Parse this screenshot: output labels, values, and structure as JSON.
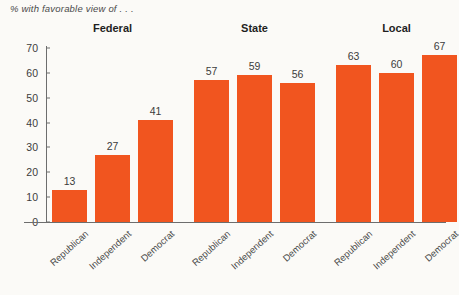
{
  "subtitle": "% with favorable view of . . .",
  "colors": {
    "bar": "#f1551f",
    "axis": "#6d6d6d",
    "text": "#3c3c3c",
    "background": "#fbfaf7"
  },
  "groups": [
    {
      "label": "Federal"
    },
    {
      "label": "State"
    },
    {
      "label": "Local"
    }
  ],
  "chart_data": {
    "type": "bar",
    "title": "% with favorable view of . . .",
    "xlabel": "",
    "ylabel": "",
    "ylim": [
      0,
      70
    ],
    "yticks": [
      0,
      10,
      20,
      30,
      40,
      50,
      60,
      70
    ],
    "grid": false,
    "legend": "none",
    "group_labels": [
      "Federal",
      "State",
      "Local"
    ],
    "categories": [
      "Republican",
      "Independent",
      "Democrat",
      "Republican",
      "Independent",
      "Democrat",
      "Republican",
      "Independent",
      "Democrat"
    ],
    "values": [
      13,
      27,
      41,
      57,
      59,
      56,
      63,
      60,
      67
    ],
    "groups": [
      {
        "name": "Federal",
        "categories": [
          "Republican",
          "Independent",
          "Democrat"
        ],
        "values": [
          13,
          27,
          41
        ]
      },
      {
        "name": "State",
        "categories": [
          "Republican",
          "Independent",
          "Democrat"
        ],
        "values": [
          57,
          59,
          56
        ]
      },
      {
        "name": "Local",
        "categories": [
          "Republican",
          "Independent",
          "Democrat"
        ],
        "values": [
          63,
          60,
          67
        ]
      }
    ]
  }
}
